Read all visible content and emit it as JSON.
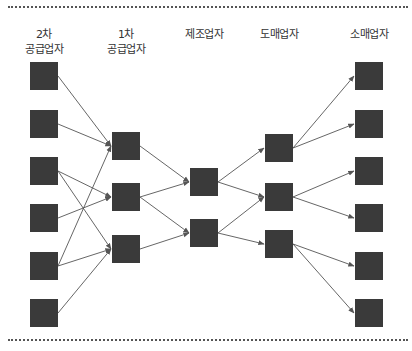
{
  "columns": [
    {
      "id": "tier2",
      "label_line1": "2차",
      "label_line2": "공급업자",
      "x": 44,
      "nodes": [
        76,
        124,
        171,
        218,
        266,
        313
      ]
    },
    {
      "id": "tier1",
      "label_line1": "1차",
      "label_line2": "공급업자",
      "x": 126,
      "nodes": [
        146,
        197,
        249
      ]
    },
    {
      "id": "manufacturer",
      "label_line1": "",
      "label_line2": "제조업자",
      "x": 204,
      "nodes": [
        182,
        233
      ]
    },
    {
      "id": "wholesaler",
      "label_line1": "",
      "label_line2": "도매업자",
      "x": 279,
      "nodes": [
        148,
        197,
        244
      ]
    },
    {
      "id": "retailer",
      "label_line1": "",
      "label_line2": "소매업자",
      "x": 369,
      "nodes": [
        76,
        124,
        171,
        218,
        266,
        313
      ]
    }
  ],
  "edges": [
    [
      0,
      0,
      1,
      0
    ],
    [
      0,
      1,
      1,
      0
    ],
    [
      0,
      2,
      1,
      1
    ],
    [
      0,
      2,
      1,
      2
    ],
    [
      0,
      3,
      1,
      1
    ],
    [
      0,
      4,
      1,
      0
    ],
    [
      0,
      4,
      1,
      2
    ],
    [
      0,
      5,
      1,
      2
    ],
    [
      1,
      0,
      2,
      0
    ],
    [
      1,
      1,
      2,
      0
    ],
    [
      1,
      1,
      2,
      1
    ],
    [
      1,
      2,
      2,
      1
    ],
    [
      2,
      0,
      3,
      0
    ],
    [
      2,
      0,
      3,
      1
    ],
    [
      2,
      1,
      3,
      1
    ],
    [
      2,
      1,
      3,
      2
    ],
    [
      3,
      0,
      4,
      0
    ],
    [
      3,
      0,
      4,
      1
    ],
    [
      3,
      1,
      4,
      2
    ],
    [
      3,
      1,
      4,
      3
    ],
    [
      3,
      2,
      4,
      4
    ],
    [
      3,
      2,
      4,
      5
    ]
  ],
  "style": {
    "node_color": "#3a3a3a",
    "edge_color": "#555555",
    "node_size": 28
  }
}
